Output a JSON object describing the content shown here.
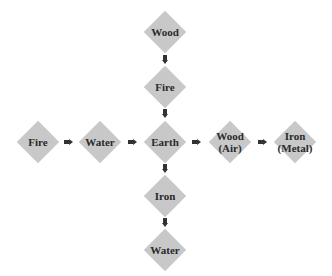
{
  "diagram": {
    "colors": {
      "node_fill": "#c8c8c8",
      "arrow": "#333333",
      "text": "#2a2a2a"
    },
    "vertical": [
      {
        "id": "v-wood",
        "lines": [
          "Wood"
        ]
      },
      {
        "id": "v-fire",
        "lines": [
          "Fire"
        ]
      },
      {
        "id": "center-earth",
        "lines": [
          "Earth"
        ]
      },
      {
        "id": "v-iron",
        "lines": [
          "Iron"
        ]
      },
      {
        "id": "v-water",
        "lines": [
          "Water"
        ]
      }
    ],
    "horizontal": [
      {
        "id": "h-fire",
        "lines": [
          "Fire"
        ]
      },
      {
        "id": "h-water",
        "lines": [
          "Water"
        ]
      },
      {
        "id": "center-earth",
        "lines": [
          "Earth"
        ]
      },
      {
        "id": "h-wood-air",
        "lines": [
          "Wood",
          "(Air)"
        ]
      },
      {
        "id": "h-iron-metal",
        "lines": [
          "Iron",
          "(Metal)"
        ]
      }
    ],
    "edges": [
      [
        "Wood",
        "Fire"
      ],
      [
        "Fire",
        "Earth"
      ],
      [
        "Earth",
        "Iron"
      ],
      [
        "Iron",
        "Water"
      ],
      [
        "Fire",
        "Water"
      ],
      [
        "Water",
        "Earth"
      ],
      [
        "Earth",
        "Wood (Air)"
      ],
      [
        "Wood (Air)",
        "Iron (Metal)"
      ]
    ]
  }
}
